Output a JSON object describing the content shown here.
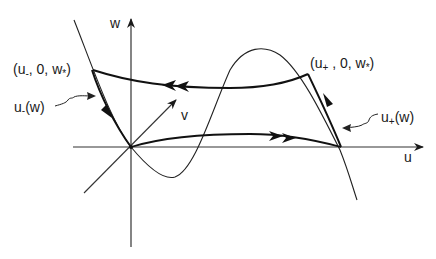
{
  "diagram": {
    "type": "phase-space heteroclinic orbit",
    "axes": {
      "u_label": "u",
      "v_label": "v",
      "w_label": "w"
    },
    "points": {
      "left_point": {
        "base": "(u",
        "sub": "-",
        "rest": ", 0, w",
        "star": "*",
        "close": ")"
      },
      "right_point": {
        "base": "(u",
        "sub": "+",
        "rest": " , 0, w",
        "star": "*",
        "close": ")"
      }
    },
    "branches": {
      "left_branch": {
        "base": "u",
        "sub": "-",
        "rest": "(w)"
      },
      "right_branch": {
        "base": "u",
        "sub": "+",
        "rest": "(w)"
      }
    },
    "colors": {
      "ink": "#1a1a1a",
      "background": "#ffffff"
    }
  }
}
